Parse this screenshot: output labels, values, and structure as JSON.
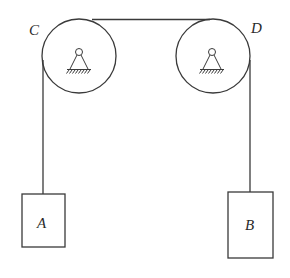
{
  "diagram": {
    "colors": {
      "line": "#3a3a3a",
      "text": "#2a2a2a",
      "background": "#ffffff"
    },
    "pulleys": [
      {
        "id": "C",
        "label": "C",
        "cx": 79,
        "cy": 56,
        "r": 37,
        "pivot": {
          "x": 79,
          "y": 52
        }
      },
      {
        "id": "D",
        "label": "D",
        "cx": 213,
        "cy": 56,
        "r": 37,
        "pivot": {
          "x": 212,
          "y": 52
        }
      }
    ],
    "blocks": [
      {
        "id": "A",
        "label": "A",
        "x": 22,
        "y": 194,
        "w": 43,
        "h": 53
      },
      {
        "id": "B",
        "label": "B",
        "x": 228,
        "y": 192,
        "w": 45,
        "h": 66
      }
    ],
    "labels": {
      "C": "C",
      "D": "D",
      "A": "A",
      "B": "B"
    }
  }
}
